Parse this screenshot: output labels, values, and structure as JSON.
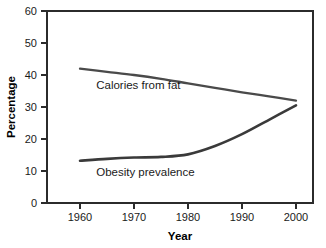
{
  "chart_data": {
    "type": "line",
    "title": "",
    "xlabel": "Year",
    "ylabel": "Percentage",
    "xlim": [
      1955,
      2005
    ],
    "ylim": [
      0,
      60
    ],
    "grid": false,
    "legend_position": "inline-annotations",
    "x_ticks": [
      "1960",
      "1970",
      "1980",
      "1990",
      "2000"
    ],
    "x_tick_values": [
      1960,
      1970,
      1980,
      1990,
      2000
    ],
    "y_ticks": [
      "0",
      "10",
      "20",
      "30",
      "40",
      "50",
      "60"
    ],
    "y_tick_values": [
      0,
      10,
      20,
      30,
      40,
      50,
      60
    ],
    "x": [
      1960,
      1965,
      1970,
      1975,
      1980,
      1985,
      1990,
      1995,
      2000
    ],
    "series": [
      {
        "name": "Calories from fat",
        "color": "#4a4a4a",
        "values": [
          42.0,
          41.0,
          40.0,
          38.8,
          37.4,
          36.0,
          34.6,
          33.3,
          32.0
        ],
        "label_x": 1963,
        "label_y": 35.5
      },
      {
        "name": "Obesity prevalence",
        "color": "#3a3a3a",
        "values": [
          13.2,
          13.8,
          14.2,
          14.4,
          15.2,
          17.8,
          21.5,
          26.0,
          30.5
        ],
        "label_x": 1963,
        "label_y": 8.5
      }
    ],
    "annotations": [
      {
        "text": "Calories from fat"
      },
      {
        "text": "Obesity prevalence"
      }
    ],
    "colors": {
      "axis": "#2b2b2b",
      "text": "#1a1a1a",
      "background": "#ffffff",
      "calories_line": "#4a4a4a",
      "obesity_line": "#3a3a3a"
    }
  }
}
